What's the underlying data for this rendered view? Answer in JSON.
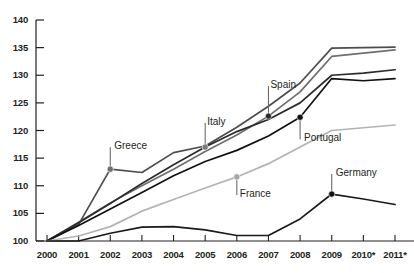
{
  "chart_data": {
    "type": "line",
    "title": "",
    "subtitle": "",
    "xlabel": "",
    "ylabel": "",
    "grid": false,
    "legend_position": "inline-callouts",
    "x": [
      "2000",
      "2001",
      "2002",
      "2003",
      "2004",
      "2005",
      "2006",
      "2007",
      "2008",
      "2009",
      "2010*",
      "2011*"
    ],
    "xtick_labels": [
      "2000",
      "2001",
      "2002",
      "2003",
      "2004",
      "2005",
      "2006",
      "2007",
      "2008",
      "2009",
      "2010*",
      "2011*"
    ],
    "ytick_labels": [
      "100",
      "105",
      "110",
      "115",
      "120",
      "125",
      "130",
      "135",
      "140"
    ],
    "ylim": [
      100,
      140
    ],
    "xlim": [
      2000,
      2011
    ],
    "series": [
      {
        "name": "Greece",
        "color": "#4d4d4d",
        "values": [
          100,
          103.0,
          113.0,
          112.4,
          116.0,
          117.2,
          120.6,
          124.4,
          128.6,
          134.9,
          135.0,
          135.1
        ]
      },
      {
        "name": "Spain",
        "color": "#6e6e6e",
        "values": [
          100,
          103.4,
          106.9,
          110.0,
          113.0,
          116.2,
          119.2,
          122.6,
          127.0,
          133.4,
          134.0,
          134.6
        ]
      },
      {
        "name": "Italy",
        "color": "#2b2b2b",
        "values": [
          100,
          103.3,
          106.8,
          110.4,
          113.8,
          117.0,
          119.8,
          122.0,
          125.0,
          130.0,
          130.4,
          131.0
        ]
      },
      {
        "name": "Portugal",
        "color": "#111111",
        "values": [
          100,
          102.8,
          105.8,
          108.8,
          111.8,
          114.4,
          116.4,
          119.0,
          122.4,
          129.4,
          129.0,
          129.4
        ]
      },
      {
        "name": "France",
        "color": "#b3b3b3",
        "values": [
          100,
          100.9,
          102.6,
          105.4,
          107.5,
          109.6,
          111.6,
          114.0,
          117.0,
          120.0,
          120.5,
          121.0
        ]
      },
      {
        "name": "Germany",
        "color": "#1a1a1a",
        "values": [
          100,
          100.0,
          101.4,
          102.5,
          102.6,
          102.0,
          101.0,
          101.0,
          104.0,
          108.5,
          107.6,
          106.6
        ]
      }
    ],
    "annotations": [
      {
        "series": "Greece",
        "x": "2002",
        "value": 113.0,
        "label": "Greece",
        "marker_color": "#6e6e6e",
        "label_dx": 10,
        "label_dy": -22
      },
      {
        "series": "Italy",
        "x": "2005",
        "value": 117.0,
        "label": "Italy",
        "marker_color": "#7a7a7a",
        "label_dx": 8,
        "label_dy": -24
      },
      {
        "series": "Spain",
        "x": "2007",
        "value": 122.6,
        "label": "Spain",
        "marker_color": "#2b2b2b",
        "label_dx": 8,
        "label_dy": -30
      },
      {
        "series": "Portugal",
        "x": "2008",
        "value": 122.4,
        "label": "Portugal",
        "marker_color": "#111111",
        "label_dx": 10,
        "label_dy": 22
      },
      {
        "series": "France",
        "x": "2006",
        "value": 111.6,
        "label": "France",
        "marker_color": "#a5a5a5",
        "label_dx": 9,
        "label_dy": 18
      },
      {
        "series": "Germany",
        "x": "2009",
        "value": 108.5,
        "label": "Germany",
        "marker_color": "#111111",
        "label_dx": 10,
        "label_dy": -20
      }
    ]
  },
  "axis": {
    "y_labels": [
      "140",
      "135",
      "130",
      "125",
      "120",
      "115",
      "110",
      "105",
      "100"
    ],
    "x_labels": [
      "2000",
      "2001",
      "2002",
      "2003",
      "2004",
      "2005",
      "2006",
      "2007",
      "2008",
      "2009",
      "2010*",
      "2011*"
    ]
  }
}
